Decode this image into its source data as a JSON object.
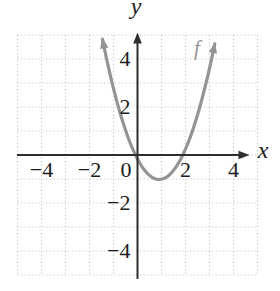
{
  "chart_data": {
    "type": "line",
    "title": "",
    "xlabel": "x",
    "ylabel": "y",
    "x_range": [
      -5,
      5
    ],
    "y_range": [
      -5,
      5
    ],
    "grid": {
      "show": true,
      "style": "dotted",
      "spacing": 1,
      "extent": [
        -5,
        5
      ]
    },
    "axes": {
      "x_arrow": "right",
      "y_arrow": "up",
      "origin_label": "0"
    },
    "x_ticks": [
      {
        "value": -4,
        "label": "−4"
      },
      {
        "value": -2,
        "label": "−2"
      },
      {
        "value": 0,
        "label": "0"
      },
      {
        "value": 2,
        "label": "2"
      },
      {
        "value": 4,
        "label": "4"
      }
    ],
    "y_ticks": [
      {
        "value": 4,
        "label": "4"
      },
      {
        "value": 2,
        "label": "2"
      },
      {
        "value": -2,
        "label": "−2"
      },
      {
        "value": -4,
        "label": "−4"
      }
    ],
    "series": [
      {
        "name": "f",
        "curve_type": "parabola",
        "opens": "up",
        "vertex": [
          1,
          -1
        ],
        "x_intercepts": [
          0,
          2
        ],
        "y_intercept": 0,
        "points": [
          [
            -1.4,
            4.8
          ],
          [
            -1,
            3
          ],
          [
            -0.5,
            1.25
          ],
          [
            0,
            0
          ],
          [
            0.5,
            -0.75
          ],
          [
            1,
            -1
          ],
          [
            1.5,
            -0.75
          ],
          [
            2,
            0
          ],
          [
            2.5,
            1.25
          ],
          [
            3,
            3
          ],
          [
            3.3,
            4.8
          ]
        ],
        "arrows": "both-ends",
        "color": "#949494",
        "drawn_fit": {
          "a": 1.05,
          "h": 0.9,
          "k": -1.02,
          "x_min": -1.46,
          "x_max": 3.26
        }
      }
    ],
    "legend": {
      "show": false
    },
    "colors": {
      "background": "#ffffff",
      "axis": "#2e2e2e",
      "grid": "#c7c7c7",
      "tick_text": "#1c1c1c",
      "curve": "#949494"
    }
  }
}
